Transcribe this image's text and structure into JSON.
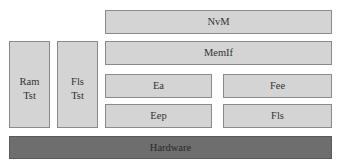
{
  "diagram": {
    "type": "layered-architecture",
    "boxes": {
      "nvm": "NvM",
      "memif": "MemIf",
      "ram_tst": [
        "Ram",
        "Tst"
      ],
      "fls_tst": [
        "Fls",
        "Tst"
      ],
      "ea": "Ea",
      "fee": "Fee",
      "eep": "Eep",
      "fls": "Fls",
      "hardware": "Hardware"
    },
    "colors": {
      "module_fill": "#d4d4d4",
      "module_border": "#8a8a8a",
      "hardware_fill": "#6e6e6e"
    }
  }
}
